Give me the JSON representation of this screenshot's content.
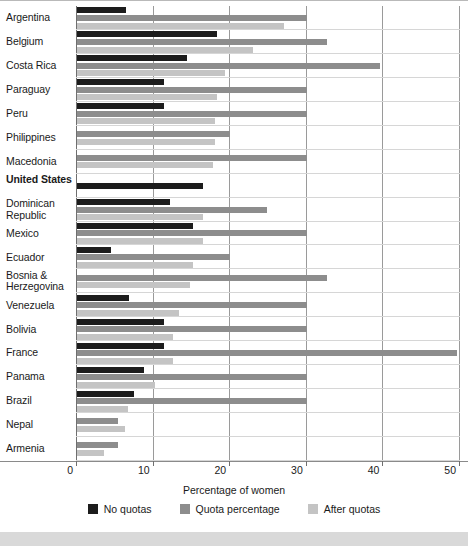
{
  "chart_data": {
    "type": "bar",
    "orientation": "horizontal",
    "title": "",
    "xlabel": "Percentage of women",
    "ylabel": "",
    "xlim": [
      0,
      52
    ],
    "xticks": [
      0,
      10,
      20,
      30,
      40,
      50
    ],
    "grid": true,
    "legend_position": "bottom",
    "categories": [
      "Argentina",
      "Belgium",
      "Costa Rica",
      "Paraguay",
      "Peru",
      "Philippines",
      "Macedonia",
      "United States",
      "Dominican Republic",
      "Mexico",
      "Ecuador",
      "Bosnia & Herzegovina",
      "Venezuela",
      "Bolivia",
      "France",
      "Panama",
      "Brazil",
      "Nepal",
      "Armenia"
    ],
    "highlighted_category": "United States",
    "series": [
      {
        "name": "No quotas",
        "color": "#1c1c1c",
        "values": [
          6.4,
          18.3,
          14.3,
          11.3,
          11.3,
          null,
          null,
          16.4,
          12.2,
          15.2,
          4.4,
          null,
          6.8,
          11.3,
          11.4,
          8.7,
          7.4,
          null,
          null
        ]
      },
      {
        "name": "Quota percentage",
        "color": "#8d8d8d",
        "values": [
          30.0,
          32.7,
          39.5,
          30.0,
          30.0,
          20.0,
          30.0,
          null,
          24.8,
          30.0,
          20.0,
          32.7,
          30.0,
          30.0,
          49.6,
          30.0,
          30.0,
          5.4,
          5.4
        ]
      },
      {
        "name": "After quotas",
        "color": "#c4c4c4",
        "values": [
          27.0,
          23.0,
          19.3,
          18.3,
          18.0,
          18.0,
          17.7,
          null,
          16.4,
          16.4,
          15.2,
          14.8,
          13.3,
          12.5,
          12.5,
          10.2,
          6.6,
          6.3,
          3.5
        ]
      }
    ]
  },
  "axis": {
    "x_title": "Percentage of women",
    "tick_labels": [
      "0",
      "10",
      "20",
      "30",
      "40",
      "50"
    ]
  },
  "legend": {
    "items": [
      {
        "label": "No quotas",
        "color": "#1c1c1c",
        "swatch": "legend-swatch-no-quotas"
      },
      {
        "label": "Quota percentage",
        "color": "#8d8d8d",
        "swatch": "legend-swatch-quota-percentage"
      },
      {
        "label": "After quotas",
        "color": "#c4c4c4",
        "swatch": "legend-swatch-after-quotas"
      }
    ]
  },
  "colors": {
    "no_quotas": "#1c1c1c",
    "quota_percentage": "#8d8d8d",
    "after_quotas": "#c4c4c4",
    "gridline": "#9a9a9a",
    "background": "#ffffff",
    "bottom_band": "#d9d9d9"
  }
}
